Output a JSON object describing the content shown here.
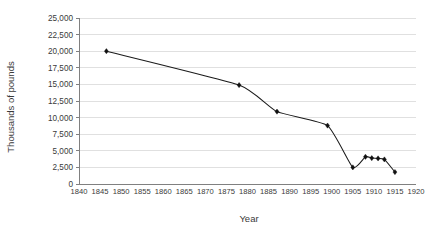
{
  "chart_data": {
    "type": "line",
    "title": "",
    "xlabel": "Year",
    "ylabel": "Thousands of pounds",
    "xlim": [
      1840,
      1920
    ],
    "ylim": [
      0,
      25000
    ],
    "grid": true,
    "legend": null,
    "marker": "diamond",
    "x_ticks": [
      1840,
      1845,
      1850,
      1855,
      1860,
      1865,
      1870,
      1875,
      1880,
      1885,
      1890,
      1895,
      1900,
      1905,
      1910,
      1915,
      1920
    ],
    "x_tick_labels": [
      "1840",
      "1845",
      "1850",
      "1855",
      "1860",
      "1865",
      "1870",
      "1875",
      "1880",
      "1885",
      "1890",
      "1895",
      "1900",
      "1905",
      "1910",
      "1915",
      "1920"
    ],
    "y_ticks": [
      0,
      2500,
      5000,
      7500,
      10000,
      12500,
      15000,
      17500,
      20000,
      22500,
      25000
    ],
    "y_tick_labels": [
      "0",
      "2,500",
      "5,000",
      "7,500",
      "10,000",
      "12,500",
      "15,000",
      "17,500",
      "20,000",
      "22,500",
      "25,000"
    ],
    "series": [
      {
        "name": "",
        "color": "#111111",
        "x": [
          1846.5,
          1878,
          1887,
          1899,
          1905,
          1908,
          1909.5,
          1911,
          1912.5,
          1915
        ],
        "values": [
          20000,
          14900,
          10900,
          8800,
          2500,
          4100,
          3900,
          3850,
          3700,
          1800
        ]
      }
    ]
  }
}
